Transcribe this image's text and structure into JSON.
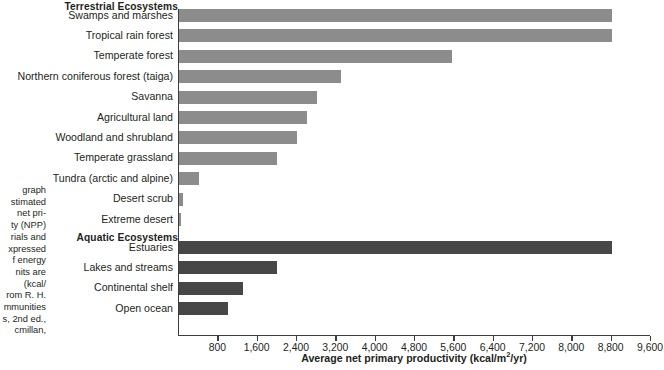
{
  "figure": {
    "caption_text": "graph\nstimated\nnet pri-\nty (NPP)\nrials and\nxpressed\nf energy\nnits are\n(kcal/\nrom R. H.\nmmunities\ns, 2nd ed.,\ncmillan,",
    "colors": {
      "terrestrial_bar": "#8c8c8c",
      "aquatic_bar": "#474747",
      "axis": "#3c3c3c",
      "text": "#231f20",
      "background": "#ffffff"
    }
  },
  "chart_data": {
    "type": "bar",
    "orientation": "horizontal",
    "title": "",
    "xlabel": "Average net primary productivity (kcal/m2/yr)",
    "xlabel_display": "Average net primary productivity (kcal/m",
    "xlabel_sup": "2",
    "xlabel_tail": "/yr)",
    "ylabel": "",
    "xlim": [
      0,
      9600
    ],
    "xtick_step": 800,
    "xticks": [
      800,
      1600,
      2400,
      3200,
      4000,
      4800,
      5600,
      6400,
      7200,
      8000,
      8800,
      9600
    ],
    "xtick_labels": [
      "800",
      "1,600",
      "2,400",
      "3,200",
      "4,000",
      "4,800",
      "5,600",
      "6,400",
      "7,200",
      "8,000",
      "8,800",
      "9,600"
    ],
    "grid": false,
    "legend_position": "none",
    "groups": [
      {
        "name": "Terrestrial Ecosystems",
        "label": "Terrestrial Ecosystems",
        "color": "#8c8c8c",
        "categories": [
          "Swamps and marshes",
          "Tropical rain forest",
          "Temperate forest",
          "Northern coniferous forest (taiga)",
          "Savanna",
          "Agricultural land",
          "Woodland and shrubland",
          "Temperate grassland",
          "Tundra (arctic and alpine)",
          "Desert scrub",
          "Extreme desert"
        ],
        "values": [
          8800,
          8800,
          5550,
          3300,
          2800,
          2600,
          2400,
          2000,
          400,
          90,
          20
        ]
      },
      {
        "name": "Aquatic Ecosystems",
        "label": "Aquatic Ecosystems",
        "color": "#474747",
        "categories": [
          "Estuaries",
          "Lakes and streams",
          "Continental shelf",
          "Open ocean"
        ],
        "values": [
          8800,
          2000,
          1300,
          1000
        ]
      }
    ]
  }
}
